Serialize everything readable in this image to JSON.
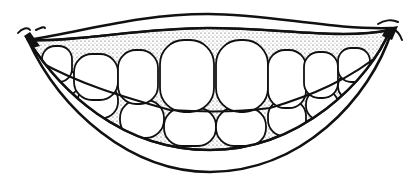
{
  "drawing": {
    "subject": "smiling mouth with teeth (line art)",
    "colors": {
      "background": "#ffffff",
      "ink": "#111111",
      "gum_stipple": "#555555",
      "tooth_fill": "#ffffff"
    },
    "upper_teeth": [
      {
        "x": 40,
        "y": 50,
        "w": 28,
        "h": 30
      },
      {
        "x": 74,
        "y": 55,
        "w": 44,
        "h": 42
      },
      {
        "x": 118,
        "y": 52,
        "w": 40,
        "h": 52
      },
      {
        "x": 160,
        "y": 42,
        "w": 54,
        "h": 70
      },
      {
        "x": 216,
        "y": 42,
        "w": 52,
        "h": 70
      },
      {
        "x": 268,
        "y": 52,
        "w": 38,
        "h": 55
      },
      {
        "x": 304,
        "y": 54,
        "w": 34,
        "h": 45
      },
      {
        "x": 340,
        "y": 52,
        "w": 30,
        "h": 32
      }
    ],
    "lower_teeth": [
      {
        "x": 50,
        "y": 72,
        "w": 26,
        "h": 22
      },
      {
        "x": 76,
        "y": 82,
        "w": 42,
        "h": 34
      },
      {
        "x": 120,
        "y": 100,
        "w": 44,
        "h": 36
      },
      {
        "x": 164,
        "y": 108,
        "w": 52,
        "h": 38
      },
      {
        "x": 216,
        "y": 108,
        "w": 50,
        "h": 38
      },
      {
        "x": 266,
        "y": 102,
        "w": 38,
        "h": 35
      },
      {
        "x": 304,
        "y": 92,
        "w": 34,
        "h": 28
      },
      {
        "x": 338,
        "y": 78,
        "w": 26,
        "h": 22
      }
    ]
  }
}
